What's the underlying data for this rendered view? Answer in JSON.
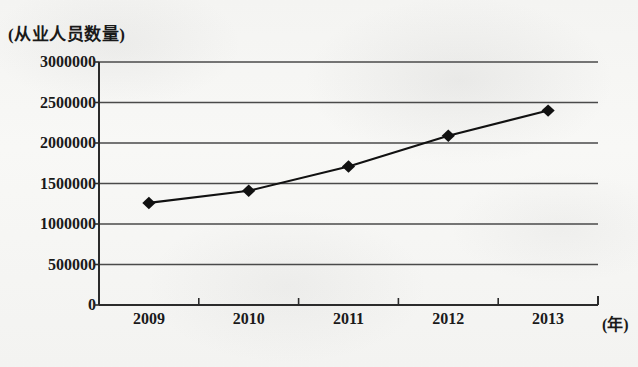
{
  "chart_data": {
    "type": "line",
    "title": "",
    "ylabel": "(从业人员数量)",
    "xlabel": "(年)",
    "categories": [
      "2009",
      "2010",
      "2011",
      "2012",
      "2013"
    ],
    "values": [
      1260000,
      1410000,
      1710000,
      2090000,
      2400000
    ],
    "series": [
      {
        "name": "从业人员数量",
        "values": [
          1260000,
          1410000,
          1710000,
          2090000,
          2400000
        ]
      }
    ],
    "ylim": [
      0,
      3000000
    ],
    "y_ticks": [
      0,
      500000,
      1000000,
      1500000,
      2000000,
      2500000,
      3000000
    ],
    "y_tick_labels": [
      "0",
      "500000",
      "1000000",
      "1500000",
      "2000000",
      "2500000",
      "3000000"
    ],
    "x_tick_labels": [
      "2009",
      "2010",
      "2011",
      "2012",
      "2013"
    ],
    "grid": true,
    "legend": "none",
    "marker": "diamond",
    "line_color": "#111111",
    "marker_color": "#111111",
    "grid_color": "#4a4a4a",
    "background_color": "#f5f5f3"
  },
  "axis": {
    "y_title": "(从业人员数量)",
    "x_title": "(年)"
  }
}
